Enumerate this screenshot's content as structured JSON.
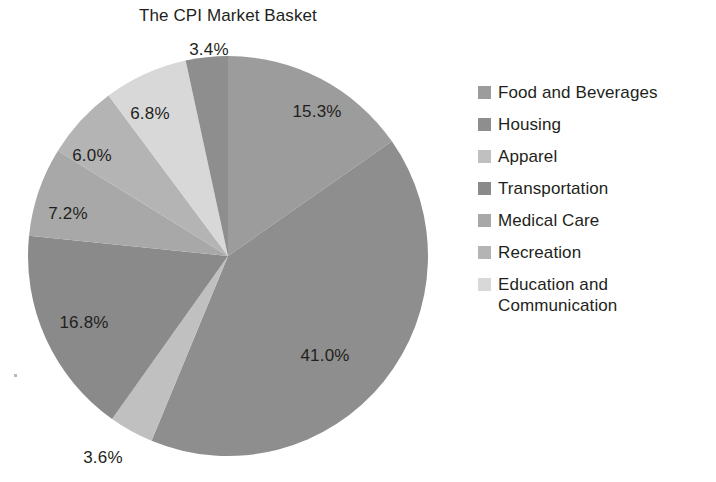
{
  "chart_data": {
    "type": "pie",
    "title": "The CPI Market Basket",
    "xlabel": "",
    "ylabel": "",
    "legend_position": "right",
    "grid": false,
    "start_angle_deg": 0,
    "direction": "clockwise",
    "categories": [
      "Food and Beverages",
      "Housing",
      "Apparel",
      "Transportation",
      "Medical Care",
      "Recreation",
      "Education and Communication",
      "Other"
    ],
    "values": [
      15.3,
      41.0,
      3.6,
      16.8,
      7.2,
      6.0,
      6.8,
      3.4
    ],
    "value_labels": [
      "15.3%",
      "41.0%",
      "3.6%",
      "16.8%",
      "7.2%",
      "6.0%",
      "6.8%",
      "3.4%"
    ],
    "colors": [
      "#9c9c9c",
      "#8e8e8e",
      "#c0c0c0",
      "#8a8a8a",
      "#a8a8a8",
      "#b4b4b4",
      "#d8d8d8",
      "#8e8e8e"
    ],
    "label_positions": [
      {
        "label": "15.3%",
        "x": 317,
        "y": 112
      },
      {
        "label": "41.0%",
        "x": 325,
        "y": 356
      },
      {
        "label": "3.6%",
        "x": 103,
        "y": 458
      },
      {
        "label": "16.8%",
        "x": 84,
        "y": 323
      },
      {
        "label": "7.2%",
        "x": 68,
        "y": 214
      },
      {
        "label": "6.0%",
        "x": 92,
        "y": 156
      },
      {
        "label": "6.8%",
        "x": 150,
        "y": 114
      },
      {
        "label": "3.4%",
        "x": 209,
        "y": 50
      }
    ]
  },
  "geometry": {
    "center_x": 228,
    "center_y": 256,
    "radius": 200
  },
  "legend": {
    "items": [
      {
        "label": "Food and Beverages",
        "color": "#9c9c9c"
      },
      {
        "label": "Housing",
        "color": "#8e8e8e"
      },
      {
        "label": "Apparel",
        "color": "#c0c0c0"
      },
      {
        "label": "Transportation",
        "color": "#8a8a8a"
      },
      {
        "label": "Medical Care",
        "color": "#a8a8a8"
      },
      {
        "label": "Recreation",
        "color": "#b4b4b4"
      },
      {
        "label": "Education and Communication",
        "color": "#d8d8d8"
      }
    ]
  }
}
